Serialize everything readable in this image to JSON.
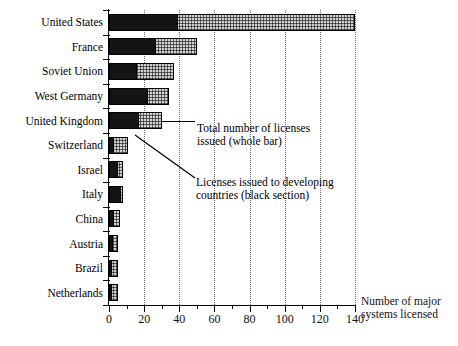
{
  "chart_data": {
    "type": "bar",
    "orientation": "horizontal",
    "title": "",
    "xlabel": "Number of major systems licensed",
    "ylabel": "",
    "xlim": [
      0,
      140
    ],
    "xticks": [
      0,
      20,
      40,
      60,
      80,
      100,
      120,
      140
    ],
    "xtick_labels": [
      "0",
      "20",
      "40",
      "60",
      "80",
      "100",
      "120",
      "140"
    ],
    "minor_tick_step": 10,
    "grid": "vertical dotted at major ticks",
    "legend_position": "inline annotations with leader lines",
    "categories": [
      "United States",
      "France",
      "Soviet Union",
      "West Germany",
      "United Kingdom",
      "Switzerland",
      "Israel",
      "Italy",
      "China",
      "Austria",
      "Brazil",
      "Netherlands"
    ],
    "series": [
      {
        "name": "Total number of licenses issued (whole bar)",
        "fill": "stippled",
        "values": [
          140,
          50,
          37,
          34,
          30,
          11,
          8,
          8,
          6,
          5,
          5,
          5
        ]
      },
      {
        "name": "Licenses issued to developing countries (black section)",
        "fill": "black",
        "values": [
          39,
          27,
          16,
          22,
          17,
          3,
          5,
          7,
          3,
          2,
          1.5,
          1
        ]
      }
    ],
    "annotations": [
      {
        "id": "total-annotation",
        "line1": "Total number of licenses",
        "line2": "issued (whole bar)"
      },
      {
        "id": "black-annotation",
        "line1": "Licenses issued to developing",
        "line2": "countries (black section)"
      }
    ],
    "axis_caption": {
      "line1": "Number of major",
      "line2": "systems licensed"
    },
    "colors": {
      "black_section": "#141414",
      "stipple_section": "#d2d2d2",
      "axis": "#000000",
      "gridline": "#6b6b6b",
      "background": "#ffffff"
    }
  }
}
